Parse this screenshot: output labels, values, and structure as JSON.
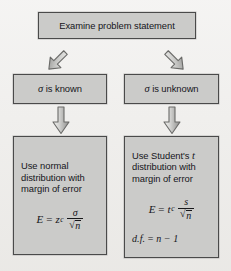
{
  "diagram": {
    "background_color": "#efeeec",
    "box_fill_color": "#cbcbc9",
    "box_border_color": "#4a4a4a",
    "text_color": "#15151a"
  },
  "nodes": {
    "top": {
      "id": "examine-problem-statement",
      "text": "Examine problem statement"
    },
    "sigma_known": {
      "id": "sigma-is-known",
      "sigma": "σ",
      "text": " is known"
    },
    "sigma_unknown": {
      "id": "sigma-is-unknown",
      "sigma": "σ",
      "text": " is unknown"
    },
    "normal": {
      "id": "use-normal-distribution",
      "line1": "Use normal",
      "line2": "distribution with",
      "line3": "margin of error",
      "formula": {
        "lhs": "E",
        "equals": "=",
        "coefficient": "z",
        "coefficient_subscript": "c",
        "numerator": "σ",
        "radical": "√",
        "radicand": "n"
      }
    },
    "student": {
      "id": "use-student-t-distribution",
      "line1_prefix": "Use Student's ",
      "line1_italic": "t",
      "line2": "distribution with",
      "line3": "margin of error",
      "formula": {
        "lhs": "E",
        "equals": "=",
        "coefficient": "t",
        "coefficient_subscript": "c",
        "numerator": "s",
        "radical": "√",
        "radicand": "n"
      },
      "degrees_of_freedom": {
        "label": "d.f.",
        "equals": " = ",
        "expression": "n − 1"
      }
    }
  },
  "arrows": [
    {
      "id": "arrow-down-left-diagonal",
      "direction": "down-left",
      "from": "examine-problem-statement",
      "to": "sigma-is-known"
    },
    {
      "id": "arrow-down-right-diagonal",
      "direction": "down-right",
      "from": "examine-problem-statement",
      "to": "sigma-is-unknown"
    },
    {
      "id": "arrow-down-left",
      "direction": "down",
      "from": "sigma-is-known",
      "to": "use-normal-distribution"
    },
    {
      "id": "arrow-down-right",
      "direction": "down",
      "from": "sigma-is-unknown",
      "to": "use-student-t-distribution"
    }
  ]
}
